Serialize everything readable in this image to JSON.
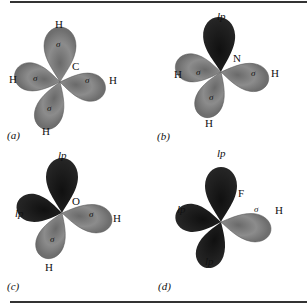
{
  "colors": {
    "sigma_lobe": "#8a8a8a",
    "sigma_lobe_dark": "#5a5a5a",
    "lone_pair_lobe": "#1c1c1c",
    "rule": "#333333"
  },
  "panels": [
    {
      "id": "a",
      "caption": "(a)",
      "central_atom": "C",
      "lobes": [
        {
          "direction": "up",
          "type": "sigma",
          "label": "σ",
          "terminal": "H"
        },
        {
          "direction": "left",
          "type": "sigma",
          "label": "σ",
          "terminal": "H"
        },
        {
          "direction": "right",
          "type": "sigma",
          "label": "σ",
          "terminal": "H"
        },
        {
          "direction": "down",
          "type": "sigma",
          "label": "σ",
          "terminal": "H"
        }
      ]
    },
    {
      "id": "b",
      "caption": "(b)",
      "central_atom": "N",
      "lobes": [
        {
          "direction": "up",
          "type": "lone_pair",
          "label": "",
          "terminal": "lp"
        },
        {
          "direction": "left",
          "type": "sigma",
          "label": "σ",
          "terminal": "H"
        },
        {
          "direction": "right",
          "type": "sigma",
          "label": "σ",
          "terminal": "H"
        },
        {
          "direction": "down",
          "type": "sigma",
          "label": "σ",
          "terminal": "H"
        }
      ]
    },
    {
      "id": "c",
      "caption": "(c)",
      "central_atom": "O",
      "lobes": [
        {
          "direction": "up",
          "type": "lone_pair",
          "label": "",
          "terminal": "lp"
        },
        {
          "direction": "left",
          "type": "lone_pair",
          "label": "",
          "terminal": "lp"
        },
        {
          "direction": "right",
          "type": "sigma",
          "label": "σ",
          "terminal": "H"
        },
        {
          "direction": "down",
          "type": "sigma",
          "label": "σ",
          "terminal": "H"
        }
      ]
    },
    {
      "id": "d",
      "caption": "(d)",
      "central_atom": "F",
      "lobes": [
        {
          "direction": "up",
          "type": "lone_pair",
          "label": "",
          "terminal": "lp"
        },
        {
          "direction": "left",
          "type": "lone_pair",
          "label": "",
          "terminal": "lp"
        },
        {
          "direction": "right",
          "type": "sigma",
          "label": "σ",
          "terminal": "H"
        },
        {
          "direction": "down",
          "type": "lone_pair",
          "label": "",
          "terminal": "lp"
        }
      ]
    }
  ]
}
